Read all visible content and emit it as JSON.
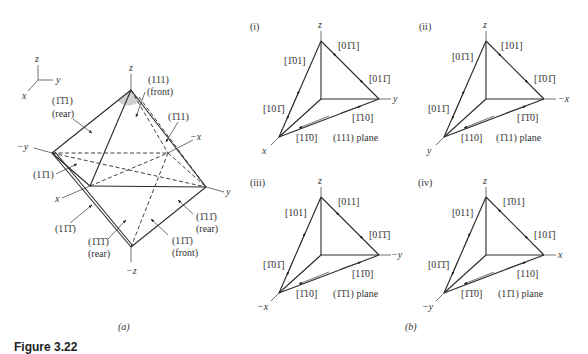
{
  "figure": {
    "caption": "Figure 3.22",
    "panel_a_label": "(a)",
    "panel_b_label": "(b)"
  },
  "panel_a": {
    "axes_triad": {
      "z": "z",
      "y": "y",
      "x": "x"
    },
    "axis_labels": {
      "z_top": "z",
      "z_bottom": "−z",
      "y_pos": "y",
      "y_neg": "−y",
      "x_pos": "x",
      "x_neg": "−x"
    },
    "planes": [
      {
        "miller": "(111)",
        "side": "(front)"
      },
      {
        "miller": "(1̄1̄1)",
        "side": "(rear)"
      },
      {
        "miller": "(1̄11)",
        "side": ""
      },
      {
        "miller": "(11̄1)",
        "side": ""
      },
      {
        "miller": "(11̄1̄)",
        "side": ""
      },
      {
        "miller": "(1̄1̄1̄)",
        "side": "(rear)"
      },
      {
        "miller": "(11̄1̄)",
        "side": "(front)"
      },
      {
        "miller": "(1̄11̄)",
        "side": "(rear)"
      }
    ]
  },
  "panel_b": [
    {
      "id": "(i)",
      "plane": "(111) plane",
      "axes": {
        "top": "z",
        "right": "y",
        "bottom": "x"
      },
      "directions": {
        "left_upper": "[1̄01]",
        "left_lower": "[101̄]",
        "right_upper": "[01̄1]",
        "right_lower": "[011̄]",
        "bottom_right": "[1̄10]",
        "bottom_left": "[11̄0]"
      }
    },
    {
      "id": "(ii)",
      "plane": "(1̄11) plane",
      "axes": {
        "top": "z",
        "right": "−x",
        "bottom": "y"
      },
      "directions": {
        "left_upper": "[01̄1]",
        "left_lower": "[011̄]",
        "right_upper": "[101]",
        "right_lower": "[1̄01̄]",
        "bottom_right": "[1̄1̄0]",
        "bottom_left": "[110]"
      }
    },
    {
      "id": "(iii)",
      "plane": "(1̄1̄1) plane",
      "axes": {
        "top": "z",
        "right": "−y",
        "bottom": "−x"
      },
      "directions": {
        "left_upper": "[101]",
        "left_lower": "[1̄01̄]",
        "right_upper": "[011]",
        "right_lower": "[01̄1̄]",
        "bottom_right": "[11̄0]",
        "bottom_left": "[1̄10]"
      }
    },
    {
      "id": "(iv)",
      "plane": "(11̄1) plane",
      "axes": {
        "top": "z",
        "right": "x",
        "bottom": "−y"
      },
      "directions": {
        "left_upper": "[011]",
        "left_lower": "[01̄1̄]",
        "right_upper": "[1̄01]",
        "right_lower": "[101̄]",
        "bottom_right": "[110]",
        "bottom_left": "[1̄1̄0]"
      }
    }
  ]
}
